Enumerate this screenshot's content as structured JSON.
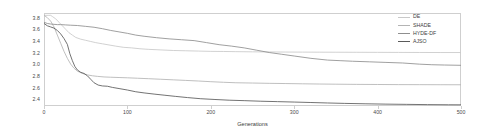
{
  "chart_data": {
    "type": "line",
    "title": "",
    "xlabel": "Generations",
    "ylabel": "",
    "xlim": [
      0,
      500
    ],
    "ylim": [
      2.3,
      3.9
    ],
    "xticks": [
      0,
      100,
      200,
      300,
      400,
      500
    ],
    "yticks": [
      2.4,
      2.6,
      2.8,
      3.0,
      3.2,
      3.4,
      3.6,
      3.8
    ],
    "xtick_labels": [
      "0",
      "100",
      "200",
      "300",
      "400",
      "500"
    ],
    "ytick_labels": [
      "2.4",
      "2.6",
      "2.8",
      "3.0",
      "3.2",
      "3.4",
      "3.6",
      "3.8"
    ],
    "grid": false,
    "legend_position": "top-right",
    "series": [
      {
        "name": "DE",
        "color": "#c9c9c9",
        "final_value": 3.22,
        "x": [
          0,
          5,
          8,
          10,
          14,
          18,
          22,
          26,
          30,
          34,
          38,
          44,
          50,
          56,
          62,
          70,
          78,
          86,
          95,
          105,
          115,
          125,
          140,
          155,
          170,
          185,
          200,
          215,
          230,
          250,
          270,
          290,
          310,
          330,
          350,
          375,
          400,
          425,
          450,
          475,
          500
        ],
        "y": [
          3.86,
          3.86,
          3.86,
          3.84,
          3.8,
          3.74,
          3.68,
          3.62,
          3.56,
          3.52,
          3.48,
          3.45,
          3.43,
          3.41,
          3.39,
          3.37,
          3.35,
          3.33,
          3.31,
          3.3,
          3.285,
          3.275,
          3.265,
          3.255,
          3.25,
          3.245,
          3.24,
          3.238,
          3.235,
          3.232,
          3.23,
          3.228,
          3.227,
          3.226,
          3.225,
          3.224,
          3.223,
          3.222,
          3.221,
          3.22,
          3.22
        ]
      },
      {
        "name": "SHADE",
        "color": "#b4b4b4",
        "final_value": 2.66,
        "x": [
          0,
          4,
          8,
          12,
          16,
          20,
          24,
          28,
          32,
          36,
          40,
          46,
          52,
          58,
          64,
          72,
          80,
          90,
          100,
          112,
          125,
          140,
          155,
          170,
          185,
          200,
          215,
          230,
          250,
          270,
          290,
          310,
          330,
          350,
          375,
          400,
          425,
          450,
          475,
          500
        ],
        "y": [
          3.86,
          3.82,
          3.76,
          3.66,
          3.52,
          3.38,
          3.24,
          3.12,
          3.02,
          2.95,
          2.9,
          2.86,
          2.835,
          2.82,
          2.81,
          2.8,
          2.795,
          2.79,
          2.785,
          2.778,
          2.77,
          2.76,
          2.75,
          2.74,
          2.73,
          2.718,
          2.708,
          2.7,
          2.695,
          2.69,
          2.686,
          2.682,
          2.678,
          2.675,
          2.672,
          2.67,
          2.668,
          2.667,
          2.666,
          2.665
        ]
      },
      {
        "name": "HYDE-DF",
        "color": "#8f8f8f",
        "final_value": 3.0,
        "x": [
          0,
          4,
          8,
          12,
          16,
          20,
          26,
          32,
          40,
          50,
          60,
          70,
          80,
          90,
          100,
          110,
          120,
          135,
          150,
          165,
          180,
          195,
          210,
          225,
          240,
          255,
          270,
          285,
          300,
          320,
          340,
          355,
          370,
          390,
          410,
          430,
          450,
          465,
          480,
          500
        ],
        "y": [
          3.74,
          3.72,
          3.71,
          3.705,
          3.7,
          3.7,
          3.695,
          3.69,
          3.685,
          3.67,
          3.655,
          3.63,
          3.6,
          3.575,
          3.55,
          3.52,
          3.5,
          3.475,
          3.455,
          3.44,
          3.425,
          3.39,
          3.355,
          3.33,
          3.3,
          3.26,
          3.22,
          3.19,
          3.16,
          3.12,
          3.09,
          3.08,
          3.07,
          3.06,
          3.05,
          3.04,
          3.02,
          3.01,
          3.005,
          3.0
        ]
      },
      {
        "name": "AJSO",
        "color": "#5a5a5a",
        "final_value": 2.32,
        "x": [
          0,
          4,
          8,
          12,
          16,
          20,
          24,
          28,
          31,
          34,
          37,
          40,
          44,
          48,
          52,
          56,
          60,
          65,
          70,
          76,
          82,
          90,
          100,
          110,
          120,
          132,
          145,
          158,
          172,
          188,
          205,
          222,
          240,
          260,
          280,
          300,
          320,
          340,
          360,
          385,
          410,
          435,
          460,
          485,
          500
        ],
        "y": [
          3.72,
          3.68,
          3.66,
          3.64,
          3.6,
          3.54,
          3.46,
          3.36,
          3.2,
          3.08,
          2.98,
          2.92,
          2.88,
          2.86,
          2.82,
          2.76,
          2.7,
          2.66,
          2.645,
          2.64,
          2.62,
          2.6,
          2.575,
          2.545,
          2.525,
          2.505,
          2.485,
          2.465,
          2.445,
          2.425,
          2.412,
          2.4,
          2.392,
          2.382,
          2.375,
          2.368,
          2.36,
          2.352,
          2.345,
          2.338,
          2.332,
          2.328,
          2.324,
          2.321,
          2.32
        ]
      }
    ]
  },
  "legend": {
    "items": [
      {
        "label": "DE"
      },
      {
        "label": "SHADE"
      },
      {
        "label": "HYDE-DF"
      },
      {
        "label": "AJSO"
      }
    ]
  }
}
